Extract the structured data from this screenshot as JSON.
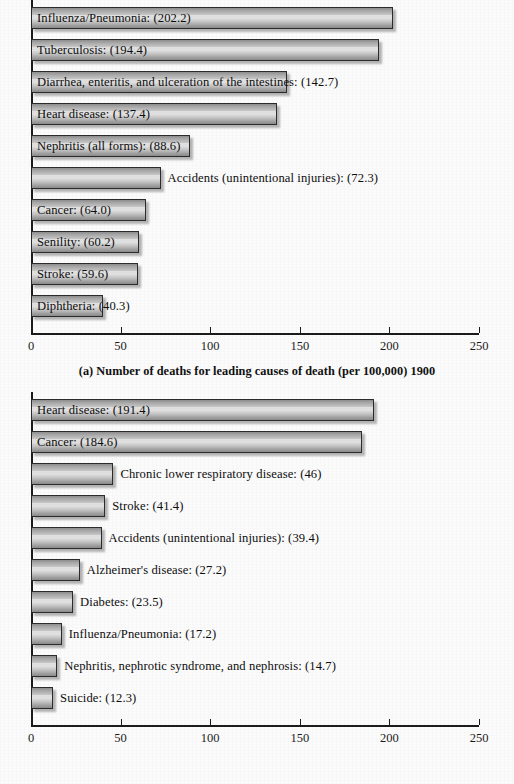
{
  "chart_data": [
    {
      "type": "bar",
      "orientation": "horizontal",
      "id": "a",
      "title": "(a) Number of deaths for leading causes of death (per 100,000) 1900",
      "xlabel": "",
      "ylabel": "",
      "xlim": [
        0,
        250
      ],
      "grid": false,
      "legend": "none",
      "xticks": [
        0,
        50,
        100,
        150,
        200,
        250
      ],
      "xtick_labels": [
        "0",
        "50",
        "100",
        "150",
        "200",
        "250"
      ],
      "categories": [
        "Influenza/Pneumonia",
        "Tuberculosis",
        "Diarrhea, enteritis, and ulceration of the intestines",
        "Heart disease",
        "Nephritis (all forms)",
        "Accidents (unintentional injuries)",
        "Cancer",
        "Senility",
        "Stroke",
        "Diphtheria"
      ],
      "values": [
        202.2,
        194.4,
        142.7,
        137.4,
        88.6,
        72.3,
        64.0,
        60.2,
        59.6,
        40.3
      ],
      "bars": [
        {
          "label": "Influenza/Pneumonia: (202.2)",
          "value": 202.2,
          "label_inside": true
        },
        {
          "label": "Tuberculosis: (194.4)",
          "value": 194.4,
          "label_inside": true
        },
        {
          "label": "Diarrhea, enteritis, and ulceration of the intestines: (142.7)",
          "value": 142.7,
          "label_inside": true
        },
        {
          "label": "Heart disease: (137.4)",
          "value": 137.4,
          "label_inside": true
        },
        {
          "label": "Nephritis (all forms): (88.6)",
          "value": 88.6,
          "label_inside": true
        },
        {
          "label": "Accidents (unintentional injuries): (72.3)",
          "value": 72.3,
          "label_inside": false
        },
        {
          "label": "Cancer: (64.0)",
          "value": 64.0,
          "label_inside": true
        },
        {
          "label": "Senility: (60.2)",
          "value": 60.2,
          "label_inside": true
        },
        {
          "label": "Stroke: (59.6)",
          "value": 59.6,
          "label_inside": true
        },
        {
          "label": "Diphtheria: (40.3)",
          "value": 40.3,
          "label_inside": true
        }
      ]
    },
    {
      "type": "bar",
      "orientation": "horizontal",
      "id": "b",
      "title": "(b) Number of deaths for leading causes of death (per 100,000) 2011",
      "xlabel": "",
      "ylabel": "",
      "xlim": [
        0,
        250
      ],
      "grid": false,
      "legend": "none",
      "xticks": [
        0,
        50,
        100,
        150,
        200,
        250
      ],
      "xtick_labels": [
        "0",
        "50",
        "100",
        "150",
        "200",
        "250"
      ],
      "categories": [
        "Heart disease",
        "Cancer",
        "Chronic lower respiratory disease",
        "Stroke",
        "Accidents (unintentional injuries)",
        "Alzheimer's disease",
        "Diabetes",
        "Influenza/Pneumonia",
        "Nephritis, nephrotic syndrome, and nephrosis",
        "Suicide"
      ],
      "values": [
        191.4,
        184.6,
        46,
        41.4,
        39.4,
        27.2,
        23.5,
        17.2,
        14.7,
        12.3
      ],
      "bars": [
        {
          "label": "Heart disease: (191.4)",
          "value": 191.4,
          "label_inside": true
        },
        {
          "label": "Cancer: (184.6)",
          "value": 184.6,
          "label_inside": true
        },
        {
          "label": "Chronic lower respiratory disease: (46)",
          "value": 46,
          "label_inside": false
        },
        {
          "label": "Stroke: (41.4)",
          "value": 41.4,
          "label_inside": false
        },
        {
          "label": "Accidents (unintentional injuries): (39.4)",
          "value": 39.4,
          "label_inside": false
        },
        {
          "label": "Alzheimer's disease: (27.2)",
          "value": 27.2,
          "label_inside": false
        },
        {
          "label": "Diabetes: (23.5)",
          "value": 23.5,
          "label_inside": false
        },
        {
          "label": "Influenza/Pneumonia: (17.2)",
          "value": 17.2,
          "label_inside": false
        },
        {
          "label": "Nephritis, nephrotic syndrome, and nephrosis: (14.7)",
          "value": 14.7,
          "label_inside": false
        },
        {
          "label": "Suicide: (12.3)",
          "value": 12.3,
          "label_inside": false
        }
      ]
    }
  ],
  "figures": {
    "a": {
      "caption": "(a) Number of deaths for leading causes of death (per 100,000) 1900"
    },
    "b": {
      "caption": "(b) Number of deaths for leading causes of death (per 100,000) 2011"
    }
  },
  "style": {
    "bar_fill": "#cfcfcf",
    "bar_edge": "#2b2b2b",
    "axis_color": "#1b1b1b",
    "text_color": "#0d0d0d",
    "background": "#fbfbfb"
  }
}
